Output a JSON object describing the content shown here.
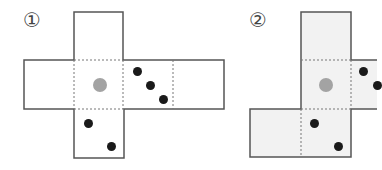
{
  "figures": [
    {
      "label": "①",
      "fill": "#ffffff",
      "cell_size": 49.5,
      "cells": [
        {
          "id": "top",
          "col": 1,
          "row": 0,
          "dots": []
        },
        {
          "id": "left",
          "col": 0,
          "row": 1,
          "dots": []
        },
        {
          "id": "center",
          "col": 1,
          "row": 1,
          "dots": [
            {
              "x": 0.5,
              "y": 0.5,
              "color": "grey"
            }
          ]
        },
        {
          "id": "right",
          "col": 2,
          "row": 1,
          "dots": [
            {
              "x": 0.27,
              "y": 0.23,
              "color": "black"
            },
            {
              "x": 0.53,
              "y": 0.51,
              "color": "black"
            },
            {
              "x": 0.8,
              "y": 0.79,
              "color": "black"
            }
          ]
        },
        {
          "id": "far-right",
          "col": 3,
          "row": 1,
          "dots": []
        },
        {
          "id": "bottom",
          "col": 1,
          "row": 2,
          "dots": [
            {
              "x": 0.28,
              "y": 0.29,
              "color": "black"
            },
            {
              "x": 0.75,
              "y": 0.76,
              "color": "black"
            }
          ]
        }
      ]
    },
    {
      "label": "②",
      "fill": "#f2f2f2",
      "cell_size": 50,
      "cells": [
        {
          "id": "top",
          "col": 1,
          "row": 0,
          "dots": []
        },
        {
          "id": "center",
          "col": 1,
          "row": 1,
          "dots": [
            {
              "x": 0.5,
              "y": 0.5,
              "color": "grey"
            }
          ]
        },
        {
          "id": "right",
          "col": 2,
          "row": 1,
          "dots": [
            {
              "x": 0.25,
              "y": 0.23,
              "color": "black"
            },
            {
              "x": 0.53,
              "y": 0.51,
              "color": "black"
            }
          ]
        },
        {
          "id": "bottom-left",
          "col": 0,
          "row": 2,
          "dots": []
        },
        {
          "id": "bottom",
          "col": 1,
          "row": 2,
          "dots": [
            {
              "x": 0.27,
              "y": 0.29,
              "color": "black"
            },
            {
              "x": 0.75,
              "y": 0.76,
              "color": "black"
            }
          ]
        }
      ]
    }
  ],
  "colors": {
    "line": "#555555",
    "grey_dot": "#a3a3a3",
    "black_dot": "#1a1a1a"
  }
}
